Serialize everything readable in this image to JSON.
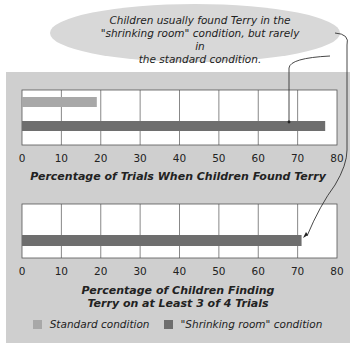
{
  "callout": {
    "text_lines": [
      "Children usually found Terry in the",
      "\"shrinking room\" condition, but rarely in",
      "the standard condition."
    ]
  },
  "colors": {
    "standard": "#a8a8a8",
    "shrinking": "#6e6e6e",
    "panel": "#cfcfcf",
    "callout": "#d8d8d8"
  },
  "chart_data": [
    {
      "type": "bar",
      "orientation": "horizontal",
      "title": "Percentage of Trials When Children Found Terry",
      "xlabel": "Percentage of Trials When Children Found Terry",
      "xlim": [
        0,
        80
      ],
      "ticks": [
        0,
        10,
        20,
        30,
        40,
        50,
        60,
        70,
        80
      ],
      "grid": true,
      "series": [
        {
          "name": "Standard condition",
          "value": 19
        },
        {
          "name": "\"Shrinking room\" condition",
          "value": 77
        }
      ]
    },
    {
      "type": "bar",
      "orientation": "horizontal",
      "title_lines": [
        "Percentage of Children Finding",
        "Terry on at Least 3 of 4 Trials"
      ],
      "xlabel": "Percentage of Children Finding Terry on at Least 3 of 4 Trials",
      "xlim": [
        0,
        80
      ],
      "ticks": [
        0,
        10,
        20,
        30,
        40,
        50,
        60,
        70,
        80
      ],
      "grid": true,
      "series": [
        {
          "name": "Standard condition",
          "value": 0
        },
        {
          "name": "\"Shrinking room\" condition",
          "value": 71
        }
      ]
    }
  ],
  "legend": {
    "position": "bottom",
    "items": [
      {
        "label": "Standard condition"
      },
      {
        "label": "\"Shrinking room\" condition"
      }
    ]
  }
}
